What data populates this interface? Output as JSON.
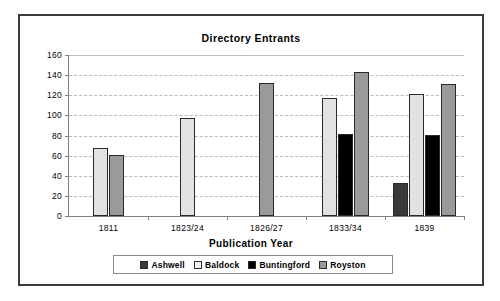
{
  "chart_data": {
    "type": "bar",
    "title": "Directory Entrants",
    "xlabel": "Publication Year",
    "ylabel": "",
    "categories": [
      "1811",
      "1823/24",
      "1826/27",
      "1833/34",
      "1839"
    ],
    "series": [
      {
        "name": "Ashwell",
        "color": "#3a3a3a",
        "values": [
          null,
          null,
          null,
          null,
          33
        ]
      },
      {
        "name": "Baldock",
        "color": "#e2e2e2",
        "values": [
          68,
          97,
          null,
          117,
          121
        ]
      },
      {
        "name": "Buntingford",
        "color": "#000000",
        "values": [
          null,
          null,
          null,
          82,
          81
        ]
      },
      {
        "name": "Royston",
        "color": "#9a9a9a",
        "values": [
          61,
          null,
          132,
          143,
          131
        ]
      }
    ],
    "ylim": [
      0,
      160
    ],
    "ytick_labels": [
      "160",
      "140",
      "120",
      "100",
      "80",
      "60",
      "40",
      "20",
      "0"
    ],
    "ytick_values": [
      160,
      140,
      120,
      100,
      80,
      60,
      40,
      20,
      0
    ],
    "grid": true,
    "legend_position": "bottom",
    "legend_entries": [
      "Ashwell",
      "Baldock",
      "Buntingford",
      "Royston"
    ]
  }
}
